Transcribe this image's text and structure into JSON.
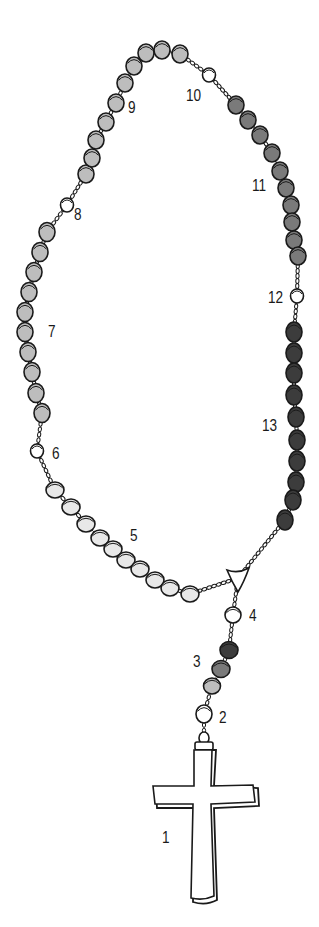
{
  "diagram": {
    "colors": {
      "outline": "#1a1a1a",
      "white_bead": "#ffffff",
      "light_bead": "#e8e8e8",
      "gray_bead": "#bdbdbd",
      "mid_bead": "#7a7a7a",
      "dark_bead": "#3c3c3c"
    },
    "labels": [
      {
        "id": "1",
        "text": "1",
        "x": 162,
        "y": 830
      },
      {
        "id": "2",
        "text": "2",
        "x": 219,
        "y": 710
      },
      {
        "id": "3",
        "text": "3",
        "x": 193,
        "y": 654
      },
      {
        "id": "4",
        "text": "4",
        "x": 249,
        "y": 608
      },
      {
        "id": "5",
        "text": "5",
        "x": 130,
        "y": 528
      },
      {
        "id": "6",
        "text": "6",
        "x": 52,
        "y": 446
      },
      {
        "id": "7",
        "text": "7",
        "x": 48,
        "y": 324
      },
      {
        "id": "8",
        "text": "8",
        "x": 74,
        "y": 207
      },
      {
        "id": "9",
        "text": "9",
        "x": 128,
        "y": 100
      },
      {
        "id": "10",
        "text": "10",
        "x": 186,
        "y": 88
      },
      {
        "id": "11",
        "text": "11",
        "x": 252,
        "y": 178
      },
      {
        "id": "12",
        "text": "12",
        "x": 268,
        "y": 290
      },
      {
        "id": "13",
        "text": "13",
        "x": 262,
        "y": 418
      }
    ],
    "beads": {
      "decade_9": [
        [
          86,
          174
        ],
        [
          92,
          158
        ],
        [
          96,
          140
        ],
        [
          106,
          122
        ],
        [
          116,
          103
        ],
        [
          125,
          83
        ],
        [
          134,
          66
        ],
        [
          146,
          53
        ],
        [
          162,
          50
        ],
        [
          180,
          54
        ]
      ],
      "bead_10": [
        209,
        75
      ],
      "decade_11": [
        [
          236,
          105
        ],
        [
          248,
          120
        ],
        [
          260,
          135
        ],
        [
          272,
          153
        ],
        [
          280,
          171
        ],
        [
          286,
          188
        ],
        [
          291,
          205
        ],
        [
          292,
          222
        ],
        [
          294,
          240
        ],
        [
          298,
          256
        ]
      ],
      "bead_12": [
        297,
        296
      ],
      "decade_13": [
        [
          294,
          332
        ],
        [
          294,
          353
        ],
        [
          294,
          373
        ],
        [
          294,
          395
        ],
        [
          296,
          417
        ],
        [
          297,
          440
        ],
        [
          297,
          461
        ],
        [
          296,
          482
        ],
        [
          293,
          500
        ],
        [
          285,
          520
        ]
      ],
      "bead_8": [
        67,
        205
      ],
      "decade_7": [
        [
          47,
          232
        ],
        [
          40,
          252
        ],
        [
          34,
          272
        ],
        [
          29,
          292
        ],
        [
          25,
          312
        ],
        [
          25,
          332
        ],
        [
          28,
          352
        ],
        [
          32,
          372
        ],
        [
          36,
          393
        ],
        [
          42,
          413
        ]
      ],
      "bead_6": [
        37,
        451
      ],
      "decade_5": [
        [
          55,
          490
        ],
        [
          71,
          507
        ],
        [
          86,
          524
        ],
        [
          100,
          538
        ],
        [
          113,
          549
        ],
        [
          126,
          560
        ],
        [
          140,
          569
        ],
        [
          155,
          580
        ],
        [
          170,
          588
        ],
        [
          190,
          594
        ]
      ],
      "centerpiece": [
        238,
        578
      ],
      "bead_4": [
        233,
        615
      ],
      "beads_3": [
        [
          229,
          650
        ],
        [
          221,
          669
        ],
        [
          212,
          686
        ]
      ],
      "bead_2": [
        204,
        714
      ]
    }
  }
}
